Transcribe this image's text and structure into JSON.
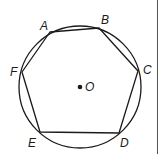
{
  "diagram": {
    "circle": {
      "center_label": "O",
      "cx": 80,
      "cy": 87,
      "r": 61
    },
    "vertices": [
      {
        "label": "A",
        "x": 50,
        "y": 32,
        "lx": 40,
        "ly": 30
      },
      {
        "label": "B",
        "x": 99,
        "y": 28,
        "lx": 101,
        "ly": 24
      },
      {
        "label": "C",
        "x": 138,
        "y": 71,
        "lx": 143,
        "ly": 74
      },
      {
        "label": "D",
        "x": 119,
        "y": 133,
        "lx": 120,
        "ly": 147
      },
      {
        "label": "E",
        "x": 40,
        "y": 132,
        "lx": 28,
        "ly": 147
      },
      {
        "label": "F",
        "x": 22,
        "y": 72,
        "lx": 10,
        "ly": 76
      }
    ],
    "colors": {
      "stroke": "#1a1a1a",
      "background": "#ffffff",
      "edge": "#555555"
    }
  }
}
